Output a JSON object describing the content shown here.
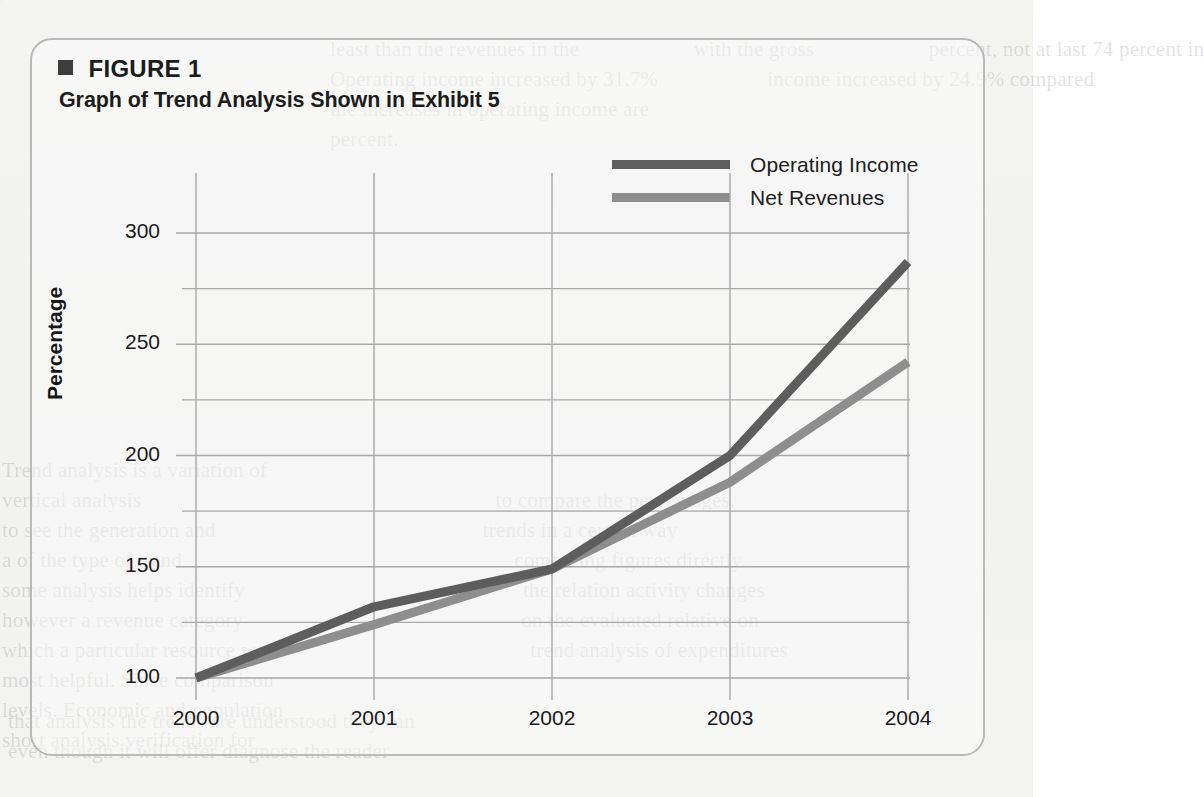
{
  "figure": {
    "bullet_icon": "filled-square-bullet",
    "label": "FIGURE 1",
    "subtitle": "Graph of Trend Analysis Shown in Exhibit 5"
  },
  "legend": {
    "position": "top-right",
    "entries": [
      {
        "label": "Operating Income",
        "color": "#5d5d5d"
      },
      {
        "label": "Net Revenues",
        "color": "#8e8e8e"
      }
    ]
  },
  "colors": {
    "operating_income": "#5d5d5d",
    "net_revenues": "#8e8e8e",
    "gridline": "#a8a8a8",
    "frame": "#b9b9b9",
    "text": "#1a1a1a"
  },
  "background_text": {
    "top": "least than the revenues in the                     with the gross                     percent, not at last 74 percent in\nOperating income increased by 31.7%                    income increased by 24.9% compared\nthe increases in operating income are\npercent.",
    "left": "Trend analysis is a variation of\nvertical analysis                                                                 to compare the percentages.\nto see the generation and                                                 trends in a certain way\na of the type of trend                                                             comparing figures directly.\nsome analysis helps identify                                                   the relation activity changes\nhowever a revenue category                                                   on the evaluated relative on\nwhich a particular resource was                                               trend analysis of expenditures\nmost helpful. Since comparison\nlevels. Economic and population\nshort analysis verification for",
    "bottom": "that analysis the trends are understood they can\neven though it will offer diagnose the reader"
  },
  "chart_data": {
    "type": "line",
    "title": "Graph of Trend Analysis Shown in Exhibit 5",
    "xlabel": "",
    "ylabel": "Percentage",
    "x": [
      "2000",
      "2001",
      "2002",
      "2003",
      "2004"
    ],
    "xlim": [
      "2000",
      "2004"
    ],
    "ylim": [
      100,
      300
    ],
    "y_ticks": [
      100,
      150,
      200,
      250,
      300
    ],
    "y_minor_ticks": [
      125,
      175,
      225,
      275
    ],
    "grid": "horizontal-major-minor-and-vertical-at-x-ticks",
    "legend_position": "top-right",
    "series": [
      {
        "name": "Operating Income",
        "color": "#5d5d5d",
        "values": [
          100,
          132,
          149,
          200,
          287
        ]
      },
      {
        "name": "Net Revenues",
        "color": "#8e8e8e",
        "values": [
          100,
          124,
          149,
          188,
          242
        ]
      }
    ]
  }
}
